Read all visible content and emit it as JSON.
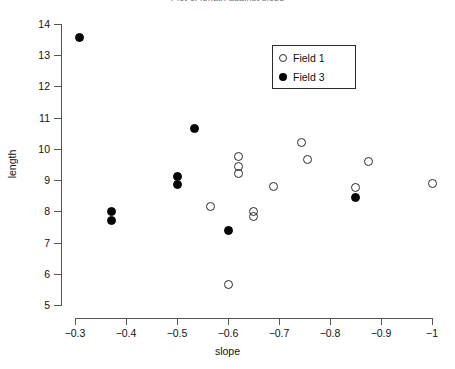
{
  "chart_data": {
    "type": "scatter",
    "title": "Plot of length against slope",
    "xlabel": "slope",
    "ylabel": "length",
    "xlim": [
      -0.3,
      -1.0
    ],
    "ylim": [
      4.6,
      14.4
    ],
    "x_ticks": [
      -0.3,
      -0.4,
      -0.5,
      -0.6,
      -0.7,
      -0.8,
      -0.9,
      -1
    ],
    "x_tick_labels": [
      "−0.3",
      "−0.4",
      "−0.5",
      "−0.6",
      "−0.7",
      "−0.8",
      "−0.9",
      "−1"
    ],
    "y_ticks": [
      5,
      6,
      7,
      8,
      9,
      10,
      11,
      12,
      13,
      14
    ],
    "y_tick_labels": [
      "5",
      "6",
      "7",
      "8",
      "9",
      "10",
      "11",
      "12",
      "13",
      "14"
    ],
    "x_axis_inverted": true,
    "grid": false,
    "legend_position": "upper center",
    "series": [
      {
        "name": "Field 1",
        "marker": "open-circle",
        "color": "#2a2a2a",
        "points": [
          {
            "x": -0.565,
            "y": 8.15
          },
          {
            "x": -0.62,
            "y": 9.75
          },
          {
            "x": -0.62,
            "y": 9.45
          },
          {
            "x": -0.62,
            "y": 9.2
          },
          {
            "x": -0.65,
            "y": 8.0
          },
          {
            "x": -0.65,
            "y": 7.85
          },
          {
            "x": -0.6,
            "y": 5.65
          },
          {
            "x": -0.69,
            "y": 8.8
          },
          {
            "x": -0.745,
            "y": 10.2
          },
          {
            "x": -0.755,
            "y": 9.65
          },
          {
            "x": -0.85,
            "y": 8.75
          },
          {
            "x": -0.875,
            "y": 9.6
          },
          {
            "x": -1.0,
            "y": 8.9
          }
        ]
      },
      {
        "name": "Field 3",
        "marker": "filled-circle",
        "color": "#050505",
        "points": [
          {
            "x": -0.308,
            "y": 13.57
          },
          {
            "x": -0.372,
            "y": 8.0
          },
          {
            "x": -0.372,
            "y": 7.7
          },
          {
            "x": -0.5,
            "y": 9.1
          },
          {
            "x": -0.5,
            "y": 8.85
          },
          {
            "x": -0.535,
            "y": 10.65
          },
          {
            "x": -0.6,
            "y": 7.4
          },
          {
            "x": -0.85,
            "y": 8.45
          }
        ]
      }
    ]
  },
  "legend": {
    "entries": [
      {
        "label": "Field 1",
        "marker": "open-circle"
      },
      {
        "label": "Field 3",
        "marker": "filled-circle"
      }
    ]
  }
}
